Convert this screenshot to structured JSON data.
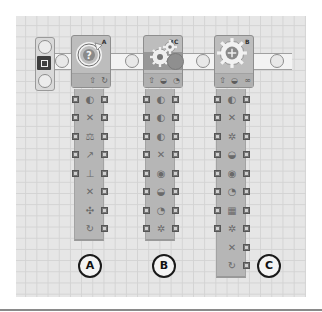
{
  "canvas": {
    "background": "#e6e6e6",
    "grid_color": "#d3d3d3"
  },
  "start": {
    "icon": "start-point-icon"
  },
  "blocks": [
    {
      "id": "A",
      "type": "rotation-sensor",
      "port_label": "A",
      "main_icon": "rotation-sensor-question-icon",
      "strip_icons": [
        "arrow-up-icon",
        "reset-icon"
      ],
      "hub_rows": [
        {
          "icon": "comparison-icon",
          "glyph": "◐"
        },
        {
          "icon": "port-icon",
          "glyph": "✕"
        },
        {
          "icon": "action-icon",
          "glyph": "⚖"
        },
        {
          "icon": "direction-icon",
          "glyph": "↗"
        },
        {
          "icon": "trigger-point-icon",
          "glyph": "⊥"
        },
        {
          "icon": "yes-no-icon",
          "glyph": "✕"
        },
        {
          "icon": "direction-out-icon",
          "glyph": "✣"
        },
        {
          "icon": "rotation-out-icon",
          "glyph": "↻"
        }
      ]
    },
    {
      "id": "B",
      "type": "move",
      "port_label": "BC",
      "main_icon": "move-gears-icon",
      "strip_icons": [
        "arrow-up-icon",
        "speed-icon",
        "duration-icon"
      ],
      "hub_rows": [
        {
          "icon": "left-motor-icon",
          "glyph": "◐"
        },
        {
          "icon": "right-motor-icon",
          "glyph": "◐"
        },
        {
          "icon": "other-motor-icon",
          "glyph": "◐"
        },
        {
          "icon": "direction-icon",
          "glyph": "✕"
        },
        {
          "icon": "steering-icon",
          "glyph": "◉"
        },
        {
          "icon": "power-icon",
          "glyph": "◒"
        },
        {
          "icon": "duration-icon",
          "glyph": "◔"
        },
        {
          "icon": "next-action-icon",
          "glyph": "✲"
        }
      ]
    },
    {
      "id": "C",
      "type": "motor",
      "port_label": "B",
      "main_icon": "motor-gear-icon",
      "strip_icons": [
        "arrow-up-icon",
        "power-icon",
        "infinity-icon"
      ],
      "hub_rows": [
        {
          "icon": "port-icon",
          "glyph": "◐"
        },
        {
          "icon": "direction-icon",
          "glyph": "✕"
        },
        {
          "icon": "action-icon",
          "glyph": "✲"
        },
        {
          "icon": "power-icon",
          "glyph": "◒"
        },
        {
          "icon": "control-icon",
          "glyph": "◉"
        },
        {
          "icon": "duration-type-icon",
          "glyph": "◔"
        },
        {
          "icon": "duration-icon",
          "glyph": "▦"
        },
        {
          "icon": "wait-icon",
          "glyph": "✲"
        },
        {
          "icon": "next-action-icon",
          "glyph": "✕"
        },
        {
          "icon": "rotation-out-icon",
          "glyph": "↻"
        }
      ]
    }
  ],
  "markers": [
    {
      "label": "A"
    },
    {
      "label": "B"
    },
    {
      "label": "C"
    }
  ]
}
